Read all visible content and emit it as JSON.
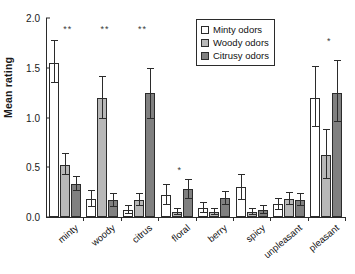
{
  "chart_data": {
    "type": "bar",
    "title": "",
    "xlabel": "",
    "ylabel": "Mean rating",
    "ylim": [
      0.0,
      2.0
    ],
    "yticks": [
      "0.0",
      "0.5",
      "1.0",
      "1.5",
      "2.0"
    ],
    "ytick_values": [
      0.0,
      0.5,
      1.0,
      1.5,
      2.0
    ],
    "grid": false,
    "legend_position": "top-right",
    "categories": [
      "minty",
      "woody",
      "citrus",
      "floral",
      "berry",
      "spicy",
      "unpleasant",
      "pleasant"
    ],
    "series": [
      {
        "name": "Minty odors",
        "color": "#ffffff",
        "values": [
          1.55,
          0.18,
          0.07,
          0.22,
          0.09,
          0.3,
          0.13,
          1.2
        ],
        "err_low": [
          1.35,
          0.1,
          0.03,
          0.12,
          0.04,
          0.17,
          0.07,
          0.9
        ],
        "err_high": [
          1.78,
          0.27,
          0.12,
          0.33,
          0.15,
          0.43,
          0.19,
          1.52
        ]
      },
      {
        "name": "Woody odors",
        "color": "#b8b8b8",
        "values": [
          0.52,
          1.2,
          0.17,
          0.05,
          0.05,
          0.05,
          0.18,
          0.62
        ],
        "err_low": [
          0.42,
          0.98,
          0.11,
          0.02,
          0.02,
          0.02,
          0.12,
          0.38
        ],
        "err_high": [
          0.64,
          1.42,
          0.24,
          0.09,
          0.09,
          0.09,
          0.25,
          0.88
        ]
      },
      {
        "name": "Citrusy odors",
        "color": "#808080",
        "values": [
          0.33,
          0.17,
          1.25,
          0.28,
          0.19,
          0.07,
          0.17,
          1.25
        ],
        "err_low": [
          0.26,
          0.1,
          0.98,
          0.18,
          0.12,
          0.03,
          0.11,
          0.95
        ],
        "err_high": [
          0.41,
          0.24,
          1.5,
          0.38,
          0.26,
          0.12,
          0.24,
          1.58
        ]
      }
    ],
    "annotations": [
      {
        "category": "minty",
        "text": "**",
        "y": 1.88
      },
      {
        "category": "woody",
        "text": "**",
        "y": 1.88
      },
      {
        "category": "citrus",
        "text": "**",
        "y": 1.88
      },
      {
        "category": "floral",
        "text": "*",
        "y": 0.46
      },
      {
        "category": "pleasant",
        "text": "*",
        "y": 1.76
      }
    ]
  },
  "legend": {
    "items": [
      {
        "label": "Minty odors"
      },
      {
        "label": "Woody odors"
      },
      {
        "label": "Citrusy odors"
      }
    ]
  }
}
